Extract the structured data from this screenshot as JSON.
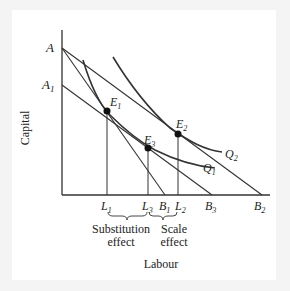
{
  "diagram": {
    "axes": {
      "y_label": "Capital",
      "x_label": "Labour"
    },
    "points": {
      "A": "A",
      "A1": "A",
      "A1_sub": "1",
      "E1": "E",
      "E1_sub": "1",
      "E2": "E",
      "E2_sub": "2",
      "E3": "E",
      "E3_sub": "3"
    },
    "curves": {
      "Q1": "Q",
      "Q1_sub": "1",
      "Q2": "Q",
      "Q2_sub": "2"
    },
    "x_ticks": {
      "L1": "L",
      "L1_sub": "1",
      "L3": "L",
      "L3_sub": "3",
      "B1": "B",
      "B1_sub": "1",
      "L2": "L",
      "L2_sub": "2",
      "B3": "B",
      "B3_sub": "3",
      "B2": "B",
      "B2_sub": "2"
    },
    "annotations": {
      "substitution_line1": "Substitution",
      "substitution_line2": "effect",
      "scale_line1": "Scale",
      "scale_line2": "effect"
    },
    "colors": {
      "line": "#333333",
      "background": "#ffffff",
      "frame": "#f4f4f4"
    }
  }
}
